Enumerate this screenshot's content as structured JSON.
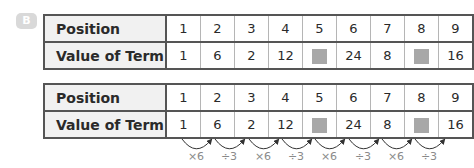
{
  "badge": {
    "label": "B"
  },
  "tables": [
    {
      "row_labels": {
        "position": "Position",
        "value": "Value of Term"
      },
      "positions": [
        "1",
        "2",
        "3",
        "4",
        "5",
        "6",
        "7",
        "8",
        "9"
      ],
      "values": [
        "1",
        "6",
        "2",
        "12",
        "",
        "24",
        "8",
        "",
        "16"
      ],
      "blank_indices": [
        4,
        7
      ]
    },
    {
      "row_labels": {
        "position": "Position",
        "value": "Value of Term"
      },
      "positions": [
        "1",
        "2",
        "3",
        "4",
        "5",
        "6",
        "7",
        "8",
        "9"
      ],
      "values": [
        "1",
        "6",
        "2",
        "12",
        "",
        "24",
        "8",
        "",
        "16"
      ],
      "blank_indices": [
        4,
        7
      ],
      "operations": [
        "×6",
        "÷3",
        "×6",
        "÷3",
        "×6",
        "÷3",
        "×6",
        "÷3"
      ]
    }
  ],
  "colors": {
    "placeholder": "#a8a8a8",
    "header_bg": "#f1f1f1",
    "border": "#555555",
    "operation_text": "#8a8a8a"
  }
}
